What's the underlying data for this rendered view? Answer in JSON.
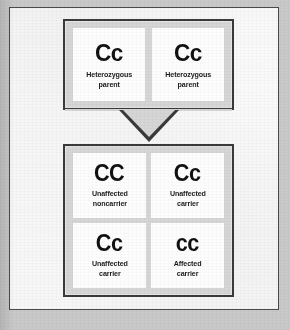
{
  "diagram": {
    "type": "punnett-square",
    "trait_symbol": "C",
    "parents": {
      "cross_label": "",
      "items": [
        {
          "genotype": "Cc",
          "caption": "Heterozygous\nparent"
        },
        {
          "genotype": "Cc",
          "caption": "Heterozygous\nparent"
        }
      ]
    },
    "offspring": {
      "items": [
        {
          "genotype": "CC",
          "caption": "Unaffected\nnoncarrier"
        },
        {
          "genotype": "Cc",
          "caption": "Unaffected\ncarrier"
        },
        {
          "genotype": "Cc",
          "caption": "Unaffected\ncarrier"
        },
        {
          "genotype": "cc",
          "caption": "Affected\ncarrier"
        }
      ]
    },
    "connector": {
      "name": "down-arrow",
      "direction": "down"
    },
    "colors": {
      "page_background": "#c9c9c9",
      "frame_background": "#fbfbfb",
      "box_fill": "#d6d6d6",
      "cell_fill": "#fdfdfd",
      "border": "#3a3a3a",
      "text": "#111111"
    }
  }
}
